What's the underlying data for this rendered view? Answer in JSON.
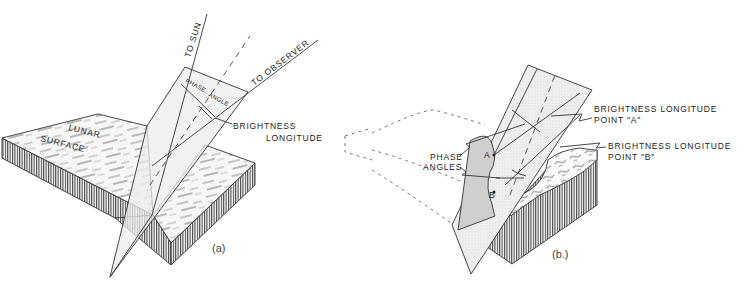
{
  "figure": {
    "panel_a": {
      "caption": "(a)",
      "labels": {
        "to_sun": "TO SUN",
        "to_observer": "TO OBSERVER",
        "phase": "PHASE",
        "angle": "ANGLE",
        "brightness": "BRIGHTNESS",
        "longitude": "LONGITUDE",
        "lunar": "LUNAR",
        "surface": "SURFACE"
      }
    },
    "panel_b": {
      "caption": "(b.)",
      "labels": {
        "phase": "PHASE",
        "angles": "ANGLES",
        "point_a": "A",
        "point_b": "B",
        "brightness_a_line1": "BRIGHTNESS  LONGITUDE",
        "brightness_a_line2": "POINT \"A\"",
        "brightness_b_line1": "BRIGHTNESS  LONGITUDE",
        "brightness_b_line2": "POINT \"B\""
      }
    },
    "colors": {
      "line": "#333333",
      "plane_fill": "#ececec",
      "shaded_fill": "#cfcfcf",
      "background": "#ffffff"
    }
  }
}
